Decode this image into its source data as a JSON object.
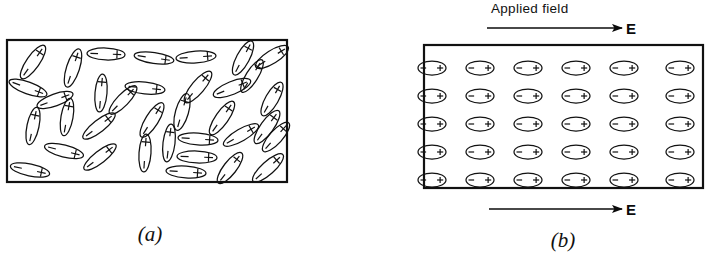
{
  "figure": {
    "background_color": "#ffffff",
    "ink_color": "#111111",
    "width": 706,
    "height": 262
  },
  "panel_a": {
    "caption": "(a)",
    "description": "Randomly oriented electric dipoles in an unpolarized dielectric slab",
    "box": {
      "x": 7,
      "y": 40,
      "width": 280,
      "height": 142
    },
    "dipole_shape": "ellipse-with-plus-and-minus-ends",
    "dipole_count": 35,
    "plus_sign": "+",
    "minus_sign": "−",
    "dipoles": [
      {
        "cx": 33,
        "cy": 62,
        "angle": -55,
        "rx": 20,
        "ry": 6.5
      },
      {
        "cx": 73,
        "cy": 68,
        "angle": -72,
        "rx": 20,
        "ry": 6.5
      },
      {
        "cx": 106,
        "cy": 54,
        "angle": 2,
        "rx": 19,
        "ry": 6.0
      },
      {
        "cx": 154,
        "cy": 58,
        "angle": 8,
        "rx": 20,
        "ry": 5.5
      },
      {
        "cx": 196,
        "cy": 57,
        "angle": -4,
        "rx": 20,
        "ry": 6.0
      },
      {
        "cx": 243,
        "cy": 58,
        "angle": -62,
        "rx": 19,
        "ry": 6.5
      },
      {
        "cx": 272,
        "cy": 57,
        "angle": -32,
        "rx": 19,
        "ry": 6.5
      },
      {
        "cx": 28,
        "cy": 88,
        "angle": 20,
        "rx": 20,
        "ry": 6.0
      },
      {
        "cx": 101,
        "cy": 93,
        "angle": -85,
        "rx": 19,
        "ry": 6.0
      },
      {
        "cx": 145,
        "cy": 88,
        "angle": 6,
        "rx": 20,
        "ry": 6.0
      },
      {
        "cx": 198,
        "cy": 87,
        "angle": -50,
        "rx": 20,
        "ry": 6.5
      },
      {
        "cx": 232,
        "cy": 88,
        "angle": -22,
        "rx": 20,
        "ry": 6.5
      },
      {
        "cx": 272,
        "cy": 99,
        "angle": -60,
        "rx": 19,
        "ry": 6.5
      },
      {
        "cx": 67,
        "cy": 117,
        "angle": -80,
        "rx": 19,
        "ry": 6.0
      },
      {
        "cx": 33,
        "cy": 126,
        "angle": -78,
        "rx": 19,
        "ry": 6.0
      },
      {
        "cx": 99,
        "cy": 126,
        "angle": -38,
        "rx": 20,
        "ry": 6.0
      },
      {
        "cx": 152,
        "cy": 120,
        "angle": -58,
        "rx": 20,
        "ry": 6.5
      },
      {
        "cx": 182,
        "cy": 112,
        "angle": -74,
        "rx": 19,
        "ry": 6.5
      },
      {
        "cx": 222,
        "cy": 118,
        "angle": -55,
        "rx": 20,
        "ry": 6.5
      },
      {
        "cx": 267,
        "cy": 127,
        "angle": -54,
        "rx": 20,
        "ry": 6.5
      },
      {
        "cx": 169,
        "cy": 143,
        "angle": -83,
        "rx": 19,
        "ry": 6.0
      },
      {
        "cx": 198,
        "cy": 139,
        "angle": 4,
        "rx": 20,
        "ry": 6.0
      },
      {
        "cx": 241,
        "cy": 135,
        "angle": -30,
        "rx": 20,
        "ry": 6.0
      },
      {
        "cx": 276,
        "cy": 137,
        "angle": -48,
        "rx": 19,
        "ry": 6.5
      },
      {
        "cx": 64,
        "cy": 151,
        "angle": 14,
        "rx": 20,
        "ry": 6.0
      },
      {
        "cx": 100,
        "cy": 157,
        "angle": -38,
        "rx": 20,
        "ry": 6.0
      },
      {
        "cx": 145,
        "cy": 153,
        "angle": -86,
        "rx": 19,
        "ry": 6.0
      },
      {
        "cx": 197,
        "cy": 157,
        "angle": 2,
        "rx": 20,
        "ry": 6.0
      },
      {
        "cx": 30,
        "cy": 170,
        "angle": 12,
        "rx": 20,
        "ry": 6.0
      },
      {
        "cx": 186,
        "cy": 172,
        "angle": 4,
        "rx": 20,
        "ry": 6.0
      },
      {
        "cx": 230,
        "cy": 168,
        "angle": -52,
        "rx": 19,
        "ry": 6.5
      },
      {
        "cx": 268,
        "cy": 168,
        "angle": -42,
        "rx": 20,
        "ry": 6.5
      },
      {
        "cx": 123,
        "cy": 100,
        "angle": -46,
        "rx": 19,
        "ry": 6.0
      },
      {
        "cx": 252,
        "cy": 76,
        "angle": -58,
        "rx": 19,
        "ry": 6.0
      },
      {
        "cx": 55,
        "cy": 100,
        "angle": -20,
        "rx": 19,
        "ry": 6.0
      }
    ]
  },
  "panel_b": {
    "caption": "(b)",
    "description": "Dipoles aligned by an applied electric field in a polarized dielectric slab",
    "box": {
      "x": 424,
      "y": 45,
      "width": 279,
      "height": 143
    },
    "grid": {
      "columns": 6,
      "rows": 5,
      "total": 30
    },
    "dipole_shape": "horizontal-ellipse-minus-left-plus-right",
    "plus_sign": "+",
    "minus_sign": "−",
    "dipole_size": {
      "rx": 14,
      "ry": 7
    },
    "column_centers": [
      432,
      480,
      528,
      576,
      624,
      680
    ],
    "row_centers": [
      68,
      96,
      124,
      152,
      180
    ],
    "applied_field_label": "Applied field",
    "field_symbol": "E",
    "arrow_top": {
      "x1": 487,
      "y1": 28,
      "x2": 622,
      "y2": 28
    },
    "arrow_bottom": {
      "x1": 489,
      "y1": 209,
      "x2": 622,
      "y2": 209
    }
  }
}
